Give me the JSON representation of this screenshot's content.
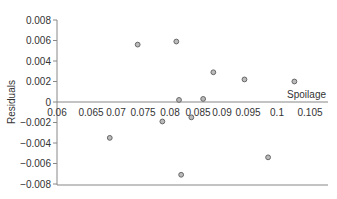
{
  "chart_data": {
    "type": "scatter",
    "title": "",
    "xlabel": "Spoilage",
    "ylabel": "Residuals",
    "xlim": [
      0.06,
      0.105
    ],
    "ylim": [
      -0.008,
      0.008
    ],
    "x_ticks": [
      "0.06",
      "0.065",
      "0.07",
      "0.075",
      "0.08",
      "0.085",
      "0.09",
      "0.095",
      "0.1",
      "0.105"
    ],
    "y_ticks": [
      "0.008",
      "0.006",
      "0.004",
      "0.002",
      "0",
      "-0.002",
      "-0.004",
      "-0.006",
      "-0.008"
    ],
    "grid": false,
    "series": [
      {
        "name": "Residuals",
        "points": [
          {
            "x": 0.0741,
            "y": 0.0056
          },
          {
            "x": 0.0813,
            "y": 0.0059
          },
          {
            "x": 0.0818,
            "y": 0.0002
          },
          {
            "x": 0.0863,
            "y": 0.0003
          },
          {
            "x": 0.0882,
            "y": 0.0029
          },
          {
            "x": 0.094,
            "y": 0.0022
          },
          {
            "x": 0.1033,
            "y": 0.002
          },
          {
            "x": 0.0787,
            "y": -0.0019
          },
          {
            "x": 0.0841,
            "y": -0.0015
          },
          {
            "x": 0.0689,
            "y": -0.0035
          },
          {
            "x": 0.0984,
            "y": -0.0054
          },
          {
            "x": 0.0822,
            "y": -0.0071
          }
        ]
      }
    ],
    "colors": {
      "axis": "#888888",
      "marker_fill": "#bbbbbb",
      "marker_stroke": "#666666"
    }
  }
}
